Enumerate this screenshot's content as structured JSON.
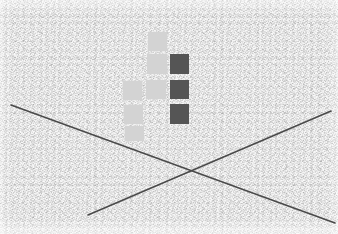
{
  "canvas": {
    "width": 338,
    "height": 234,
    "background_color": "#f4f4f4",
    "texture": "grainy-noise"
  },
  "palette": {
    "background": "#f4f4f4",
    "light_square": "#d3d3d3",
    "dark_square": "#555555",
    "line": "#4a4a4a"
  },
  "scene": {
    "title": "Abstract grayscale composition",
    "description": "Noisy light-gray textured field with a cluster of light gray squares arranged in a cross shape, three dark gray squares forming a right-hand column, and two long dark diagonal lines crossing in an X near the lower center.",
    "element_count": 11
  },
  "squares": {
    "label": "square-cluster",
    "size": 19,
    "items": [
      {
        "name": "light-square-top",
        "tone": "light",
        "x": 148,
        "y": 32,
        "w": 19,
        "h": 19,
        "color": "#d3d3d3"
      },
      {
        "name": "light-square-upper-middle",
        "tone": "light",
        "x": 147,
        "y": 54,
        "w": 20,
        "h": 20,
        "color": "#d3d3d3"
      },
      {
        "name": "light-square-center",
        "tone": "light",
        "x": 146,
        "y": 80,
        "w": 20,
        "h": 19,
        "color": "#d3d3d3"
      },
      {
        "name": "light-square-left-center",
        "tone": "light",
        "x": 123,
        "y": 81,
        "w": 19,
        "h": 19,
        "color": "#d3d3d3"
      },
      {
        "name": "light-square-left-lower",
        "tone": "light",
        "x": 124,
        "y": 105,
        "w": 19,
        "h": 19,
        "color": "#d3d3d3"
      },
      {
        "name": "light-square-bottom",
        "tone": "light",
        "x": 125,
        "y": 126,
        "w": 19,
        "h": 15,
        "color": "#d3d3d3"
      },
      {
        "name": "dark-square-top",
        "tone": "dark",
        "x": 170,
        "y": 54,
        "w": 19,
        "h": 20,
        "color": "#555555"
      },
      {
        "name": "dark-square-middle",
        "tone": "dark",
        "x": 170,
        "y": 80,
        "w": 19,
        "h": 19,
        "color": "#555555"
      },
      {
        "name": "dark-square-bottom",
        "tone": "dark",
        "x": 170,
        "y": 104,
        "w": 19,
        "h": 20,
        "color": "#555555"
      }
    ]
  },
  "lines": {
    "label": "crossing-diagonals",
    "stroke_color": "#4a4a4a",
    "stroke_width": 1.6,
    "items": [
      {
        "name": "diagonal-descending",
        "x1": 11,
        "y1": 105,
        "x2": 335,
        "y2": 223
      },
      {
        "name": "diagonal-ascending",
        "x1": 88,
        "y1": 215,
        "x2": 331,
        "y2": 111
      }
    ],
    "intersection": {
      "x": 187,
      "y": 172
    }
  }
}
